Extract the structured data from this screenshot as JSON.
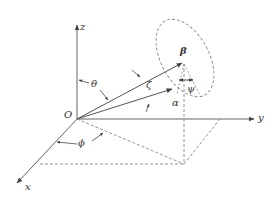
{
  "diagram": {
    "type": "3d-coordinate-system",
    "colors": {
      "line": "#555555",
      "dashed": "#888888",
      "text": "#333333",
      "background": "#ffffff"
    },
    "origin": {
      "label": "O",
      "x": 77,
      "y": 119
    },
    "axes": [
      {
        "name": "x",
        "label": "x",
        "from": [
          77,
          119
        ],
        "to": [
          16,
          184
        ]
      },
      {
        "name": "y",
        "label": "y",
        "from": [
          77,
          119
        ],
        "to": [
          254,
          119
        ]
      },
      {
        "name": "z",
        "label": "z",
        "from": [
          77,
          119
        ],
        "to": [
          77,
          24
        ]
      }
    ],
    "vectors": [
      {
        "name": "upper-vector",
        "from": [
          77,
          119
        ],
        "to": [
          183,
          63
        ]
      },
      {
        "name": "lower-vector",
        "from": [
          77,
          119
        ],
        "to": [
          173,
          89
        ]
      }
    ],
    "angle_labels": {
      "theta": "θ",
      "phi": "ϕ",
      "zeta": "ζ",
      "alpha": "α",
      "beta": "β",
      "psi": "ψ"
    },
    "projection_point": [
      184,
      164
    ]
  }
}
